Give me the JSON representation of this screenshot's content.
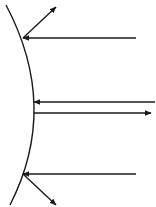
{
  "diagram": {
    "title": "Reflection of parallel rays from a convex mirror",
    "stroke_color": "#1a1a1a",
    "background": "#ffffff",
    "mirror": {
      "type": "convex-curved-surface",
      "path": "M 6 5 Q 60 107 10 205"
    },
    "rays": [
      {
        "name": "top",
        "incident": {
          "x1": 136,
          "y1": 38,
          "x2": 23,
          "y2": 38
        },
        "reflected": {
          "x1": 23,
          "y1": 38,
          "x2": 56,
          "y2": 7
        }
      },
      {
        "name": "middle",
        "incident": {
          "x1": 155,
          "y1": 102,
          "x2": 34,
          "y2": 102
        },
        "reflected": {
          "x1": 34,
          "y1": 113,
          "x2": 151,
          "y2": 113
        }
      },
      {
        "name": "bottom",
        "incident": {
          "x1": 136,
          "y1": 174,
          "x2": 23,
          "y2": 174
        },
        "reflected": {
          "x1": 23,
          "y1": 174,
          "x2": 56,
          "y2": 205
        }
      }
    ]
  }
}
